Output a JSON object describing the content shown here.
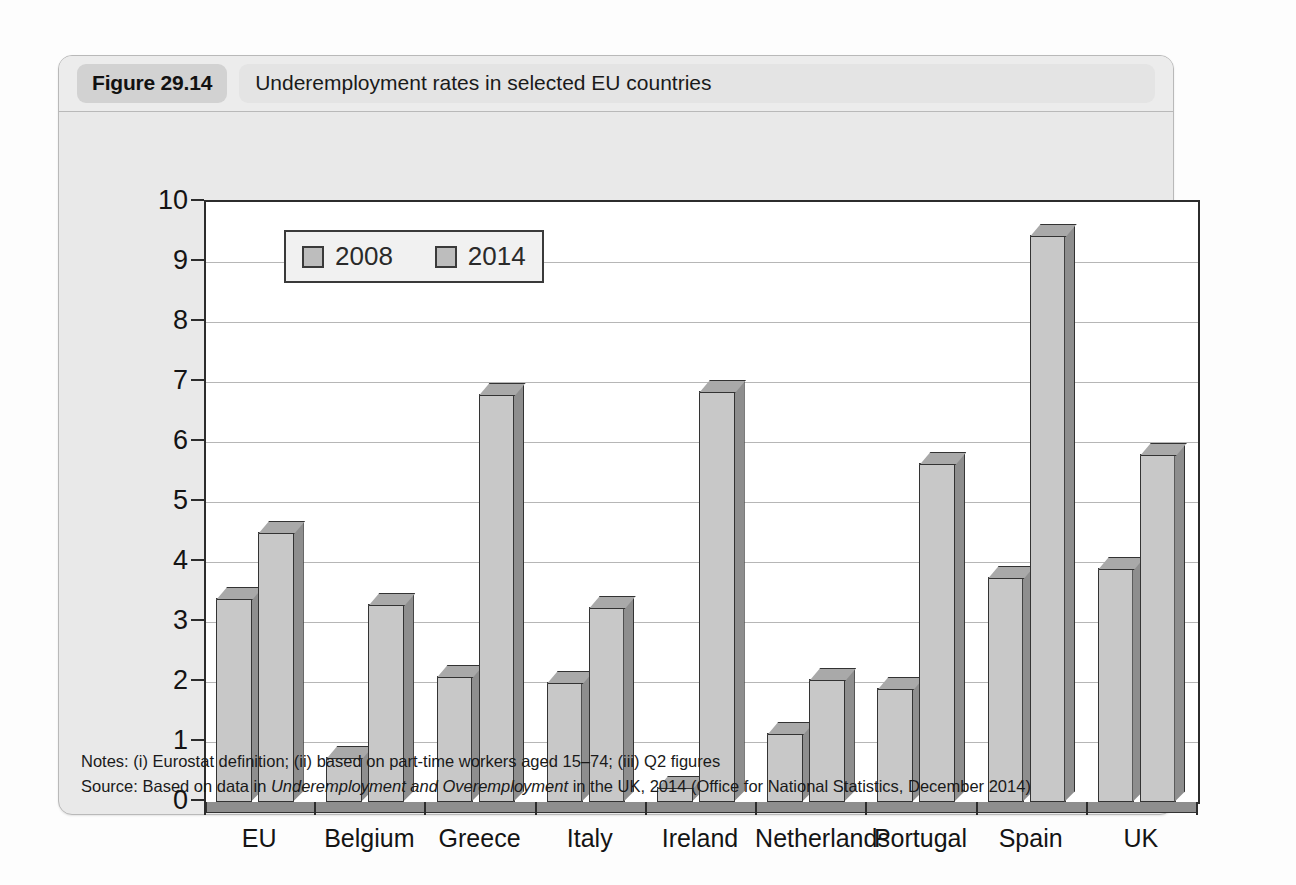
{
  "figure": {
    "number": "Figure 29.14",
    "title": "Underemployment rates in selected EU countries",
    "notes_label": "Notes:",
    "notes_text": "(i) Eurostat definition; (ii) based on part-time workers aged 15–74; (iii) Q2 figures",
    "source_label": "Source:",
    "source_prefix": "Based on data in ",
    "source_italic": "Underemployment and Overemployment",
    "source_suffix": " in the UK, 2014 (Office for National Statistics, December 2014)"
  },
  "colors": {
    "bar_front": "#c8c8c8",
    "bar_side": "#8e8e8e",
    "bar_top": "#a9a9a9",
    "outline": "#333333",
    "card_background": "#e9e9e9",
    "plot_background": "#ffffff",
    "gridline": "#b6b6b6"
  },
  "chart_data": {
    "type": "bar",
    "title": "Underemployment rates in selected EU countries",
    "xlabel": "",
    "ylabel": "",
    "ylim": [
      0,
      10
    ],
    "yticks": [
      0,
      1,
      2,
      3,
      4,
      5,
      6,
      7,
      8,
      9,
      10
    ],
    "ytick_labels": [
      "0",
      "1",
      "2",
      "3",
      "4",
      "5",
      "6",
      "7",
      "8",
      "9",
      "10"
    ],
    "grid": true,
    "legend_position": "top-left inside",
    "categories": [
      "EU",
      "Belgium",
      "Greece",
      "Italy",
      "Ireland",
      "Netherlands",
      "Portugal",
      "Spain",
      "UK"
    ],
    "series": [
      {
        "name": "2008",
        "values": [
          3.4,
          0.75,
          2.1,
          2.0,
          0.25,
          1.15,
          1.9,
          3.75,
          3.9
        ]
      },
      {
        "name": "2014",
        "values": [
          4.5,
          3.3,
          6.8,
          3.25,
          6.85,
          2.05,
          5.65,
          9.45,
          5.8
        ]
      }
    ]
  }
}
